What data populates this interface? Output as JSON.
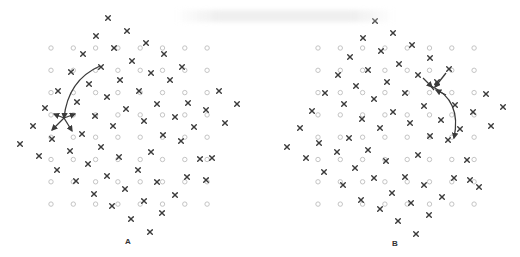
{
  "figure": {
    "type": "crystal lattice diagram",
    "colors": {
      "lattice_site": "#c4c4c4",
      "atom": "#3a3a3a",
      "arrow": "#3a3a3a",
      "label": "#333333"
    },
    "legend_symbols": {
      "lattice_site": "open-circle",
      "atom": "cross"
    }
  },
  "panels": [
    {
      "id": "A",
      "label": "A",
      "lattice": {
        "cols": 8,
        "rows": 8,
        "x0": 51,
        "y0": 48,
        "step": 22.3
      },
      "atoms": [
        [
          108,
          18
        ],
        [
          127,
          31
        ],
        [
          96,
          36
        ],
        [
          146,
          43
        ],
        [
          114,
          48
        ],
        [
          164,
          54
        ],
        [
          83,
          54
        ],
        [
          132,
          61
        ],
        [
          101,
          67
        ],
        [
          71,
          72
        ],
        [
          151,
          73
        ],
        [
          182,
          67
        ],
        [
          120,
          80
        ],
        [
          89,
          84
        ],
        [
          170,
          80
        ],
        [
          58,
          91
        ],
        [
          139,
          91
        ],
        [
          219,
          91
        ],
        [
          77,
          102
        ],
        [
          107,
          97
        ],
        [
          188,
          103
        ],
        [
          157,
          104
        ],
        [
          237,
          104
        ],
        [
          45,
          108
        ],
        [
          126,
          109
        ],
        [
          95,
          116
        ],
        [
          206,
          110
        ],
        [
          175,
          117
        ],
        [
          144,
          121
        ],
        [
          33,
          126
        ],
        [
          113,
          126
        ],
        [
          194,
          127
        ],
        [
          225,
          123
        ],
        [
          82,
          134
        ],
        [
          52,
          139
        ],
        [
          163,
          135
        ],
        [
          101,
          147
        ],
        [
          181,
          141
        ],
        [
          20,
          144
        ],
        [
          39,
          156
        ],
        [
          70,
          151
        ],
        [
          151,
          152
        ],
        [
          119,
          157
        ],
        [
          200,
          159
        ],
        [
          88,
          164
        ],
        [
          138,
          170
        ],
        [
          57,
          170
        ],
        [
          107,
          176
        ],
        [
          187,
          177
        ],
        [
          76,
          181
        ],
        [
          157,
          182
        ],
        [
          125,
          189
        ],
        [
          94,
          194
        ],
        [
          144,
          201
        ],
        [
          175,
          195
        ],
        [
          112,
          206
        ],
        [
          162,
          213
        ],
        [
          131,
          219
        ],
        [
          150,
          232
        ],
        [
          212,
          158
        ],
        [
          206,
          180
        ]
      ],
      "arrows": [
        {
          "path": "M100,66 Q68,80 64,118",
          "head": true
        },
        {
          "path": "M64,118 L52,130",
          "head": true
        },
        {
          "path": "M64,118 L72,131",
          "head": true
        },
        {
          "path": "M64,118 L54,114",
          "head": true
        },
        {
          "path": "M64,118 L75,114",
          "head": true
        }
      ]
    },
    {
      "id": "B",
      "label": "B",
      "lattice": {
        "cols": 8,
        "rows": 8,
        "x0": 318,
        "y0": 48,
        "step": 22.3
      },
      "atoms": [
        [
          375,
          21
        ],
        [
          393,
          33
        ],
        [
          363,
          38
        ],
        [
          412,
          45
        ],
        [
          381,
          51
        ],
        [
          350,
          57
        ],
        [
          430,
          58
        ],
        [
          399,
          64
        ],
        [
          368,
          70
        ],
        [
          338,
          75
        ],
        [
          418,
          75
        ],
        [
          449,
          69
        ],
        [
          387,
          82
        ],
        [
          356,
          86
        ],
        [
          437,
          82
        ],
        [
          325,
          93
        ],
        [
          405,
          93
        ],
        [
          486,
          94
        ],
        [
          344,
          104
        ],
        [
          374,
          99
        ],
        [
          455,
          105
        ],
        [
          424,
          106
        ],
        [
          503,
          107
        ],
        [
          312,
          111
        ],
        [
          393,
          112
        ],
        [
          362,
          119
        ],
        [
          473,
          112
        ],
        [
          441,
          120
        ],
        [
          410,
          123
        ],
        [
          300,
          128
        ],
        [
          380,
          128
        ],
        [
          460,
          129
        ],
        [
          491,
          126
        ],
        [
          349,
          138
        ],
        [
          319,
          143
        ],
        [
          430,
          136
        ],
        [
          368,
          150
        ],
        [
          448,
          140
        ],
        [
          287,
          147
        ],
        [
          306,
          158
        ],
        [
          337,
          152
        ],
        [
          418,
          155
        ],
        [
          386,
          161
        ],
        [
          467,
          160
        ],
        [
          355,
          168
        ],
        [
          405,
          177
        ],
        [
          324,
          172
        ],
        [
          374,
          178
        ],
        [
          454,
          178
        ],
        [
          343,
          185
        ],
        [
          424,
          185
        ],
        [
          392,
          193
        ],
        [
          361,
          200
        ],
        [
          411,
          203
        ],
        [
          442,
          197
        ],
        [
          380,
          209
        ],
        [
          429,
          215
        ],
        [
          398,
          221
        ],
        [
          416,
          234
        ],
        [
          470,
          180
        ],
        [
          479,
          187
        ]
      ],
      "arrows": [
        {
          "path": "M434,90 L430,85",
          "head": false
        },
        {
          "path": "M446,73 L435,87",
          "head": true
        },
        {
          "path": "M423,78 L432,87",
          "head": true
        },
        {
          "path": "M446,95 L436,90",
          "head": true
        },
        {
          "path": "M431,86 Q462,100 454,138",
          "head": true
        }
      ]
    }
  ]
}
